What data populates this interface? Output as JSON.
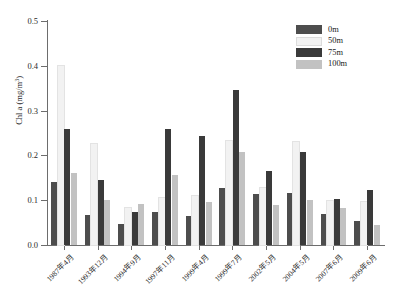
{
  "chart_data": {
    "type": "bar",
    "title": "",
    "xlabel": "",
    "ylabel": "Chl a (mg/m3)",
    "ylabel_text": "Chl a (mg/m",
    "ylabel_sup": "3",
    "ylabel_close": ")",
    "ylim": [
      0.0,
      0.5
    ],
    "ytick_labels": [
      "0.0",
      "0.1",
      "0.2",
      "0.3",
      "0.4",
      "0.5"
    ],
    "ytick_values": [
      0.0,
      0.1,
      0.2,
      0.3,
      0.4,
      0.5
    ],
    "grid": false,
    "legend_position": "top-right",
    "categories": [
      "1987年4月",
      "1993年12月",
      "1994年9月",
      "1997年11月",
      "1999年4月",
      "1999年7月",
      "2002年5月",
      "2004年5月",
      "2007年6月",
      "2009年6月"
    ],
    "series": [
      {
        "name": "0m",
        "color": "#4d4d4d",
        "values": [
          0.141,
          0.067,
          0.047,
          0.074,
          0.065,
          0.128,
          0.113,
          0.115,
          0.07,
          0.053
        ]
      },
      {
        "name": "50m",
        "color": "#f2f2f2",
        "values": [
          0.4,
          0.225,
          0.082,
          0.105,
          0.11,
          0.232,
          0.128,
          0.23,
          0.098,
          0.097
        ]
      },
      {
        "name": "75m",
        "color": "#3a3a3a",
        "values": [
          0.26,
          0.145,
          0.073,
          0.26,
          0.244,
          0.345,
          0.165,
          0.207,
          0.103,
          0.122
        ]
      },
      {
        "name": "100m",
        "color": "#c2c2c2",
        "values": [
          0.161,
          0.1,
          0.092,
          0.157,
          0.096,
          0.208,
          0.09,
          0.1,
          0.082,
          0.044
        ]
      }
    ]
  },
  "legend": {
    "items": [
      {
        "label": "0m",
        "color": "#4d4d4d"
      },
      {
        "label": "50m",
        "color": "#f2f2f2"
      },
      {
        "label": "75m",
        "color": "#3a3a3a"
      },
      {
        "label": "100m",
        "color": "#c2c2c2"
      }
    ]
  }
}
